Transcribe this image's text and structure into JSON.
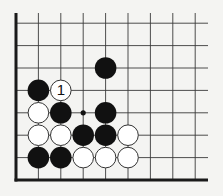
{
  "diagram": {
    "type": "go-board-fragment",
    "background": "#f4f4f2",
    "line_color": "#3a3a3a",
    "border_color": "#1a1a1a",
    "black_stone_color": "#111111",
    "white_stone_fill": "#ffffff",
    "white_stone_stroke": "#333333",
    "grid": {
      "origin_x": 16,
      "origin_y": 180,
      "spacing": 22.4,
      "columns": 9,
      "rows": 8,
      "top_y": 13,
      "right_x": 208,
      "edges": [
        "left",
        "bottom"
      ]
    },
    "stones": [
      {
        "color": "black",
        "col": 4,
        "row": 5
      },
      {
        "color": "black",
        "col": 1,
        "row": 4
      },
      {
        "color": "white",
        "col": 2,
        "row": 4,
        "label": "1"
      },
      {
        "color": "white",
        "col": 1,
        "row": 3
      },
      {
        "color": "black",
        "col": 2,
        "row": 3
      },
      {
        "color": "black",
        "col": 4,
        "row": 3
      },
      {
        "color": "white",
        "col": 1,
        "row": 2
      },
      {
        "color": "white",
        "col": 2,
        "row": 2
      },
      {
        "color": "black",
        "col": 3,
        "row": 2
      },
      {
        "color": "black",
        "col": 4,
        "row": 2
      },
      {
        "color": "white",
        "col": 5,
        "row": 2
      },
      {
        "color": "black",
        "col": 1,
        "row": 1
      },
      {
        "color": "black",
        "col": 2,
        "row": 1
      },
      {
        "color": "white",
        "col": 3,
        "row": 1
      },
      {
        "color": "white",
        "col": 4,
        "row": 1
      },
      {
        "color": "white",
        "col": 5,
        "row": 1
      }
    ],
    "markers": [
      {
        "type": "dot",
        "col": 3,
        "row": 3
      }
    ]
  }
}
